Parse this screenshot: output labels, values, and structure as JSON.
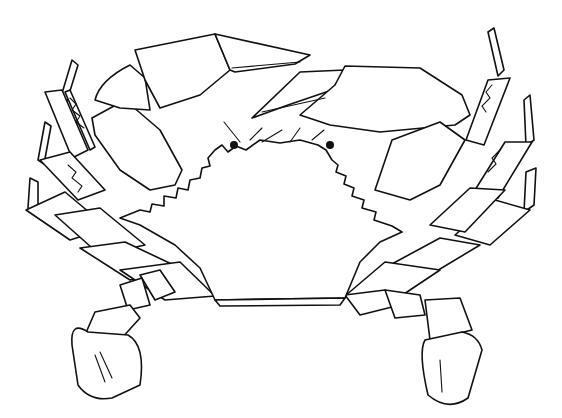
{
  "image": {
    "subject": "crab",
    "style": "black-and-white stippled line drawing",
    "colors": {
      "background": "#ffffff",
      "ink": "#111111"
    },
    "parts": [
      "carapace",
      "left-cheliped",
      "right-cheliped",
      "left-walking-legs",
      "right-walking-legs",
      "left-swimming-paddle",
      "right-swimming-paddle",
      "eyes",
      "antennae"
    ]
  }
}
